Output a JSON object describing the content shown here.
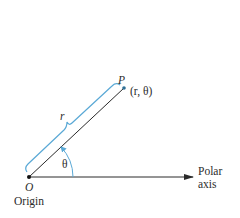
{
  "diagram": {
    "colors": {
      "line": "#2a2a2a",
      "brace": "#5aa9d6",
      "arc": "#5aa9d6",
      "point_p": "#2e6f96",
      "origin_dot": "#111111",
      "text": "#2b2b2b"
    },
    "points": {
      "origin": {
        "label": "O",
        "caption": "Origin",
        "x": 29,
        "y": 177
      },
      "p": {
        "label": "P",
        "coords_label": "(r, θ)",
        "x": 124,
        "y": 88
      }
    },
    "polar_axis": {
      "label_line1": "Polar",
      "label_line2": "axis",
      "x_end": 193
    },
    "radius": {
      "label": "r"
    },
    "angle": {
      "label": "θ",
      "arc_radius": 44
    }
  }
}
